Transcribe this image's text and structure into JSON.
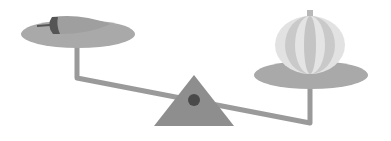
{
  "illustration": {
    "subject": "balance-scale",
    "left_item": "pepper",
    "right_item": "pumpkin",
    "colors": {
      "background": "#ffffff",
      "plate": "#a9a9a9",
      "beam": "#9a9a9a",
      "fulcrum": "#8e8e8e",
      "pivot": "#4a4a4a",
      "pepper_body": "#9f9f9f",
      "pepper_cap": "#555555",
      "pumpkin_light": "#e2e2e2",
      "pumpkin_dark": "#c4c4c4",
      "stem": "#b8b8b8"
    }
  }
}
